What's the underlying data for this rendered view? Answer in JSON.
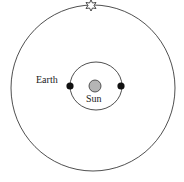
{
  "diagram": {
    "labels": {
      "earth": "Earth",
      "sun": "Sun"
    },
    "colors": {
      "line": "#222222",
      "earth": "#111111",
      "sun_fill": "#b5b5b5",
      "background": "#ffffff"
    },
    "elements": {
      "outer_orbit": "distant-star-sphere",
      "inner_orbit": "earth-orbit",
      "star": "star-icon",
      "earth_positions": 2
    }
  }
}
